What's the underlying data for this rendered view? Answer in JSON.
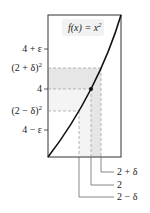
{
  "figure": {
    "function_label": "f(x) = x",
    "function_exponent": "2",
    "y_ticks": [
      {
        "id": "4-plus-eps",
        "label": "4 + ε"
      },
      {
        "id": "2-plus-delta-sq",
        "label": "(2 + δ)",
        "sup": "2"
      },
      {
        "id": "4",
        "label": "4"
      },
      {
        "id": "2-minus-delta-sq",
        "label": "(2 − δ)",
        "sup": "2"
      },
      {
        "id": "4-minus-eps",
        "label": "4 − ε"
      }
    ],
    "x_ticks": [
      {
        "id": "2-plus-delta",
        "label": "2 + δ"
      },
      {
        "id": "2",
        "label": "2"
      },
      {
        "id": "2-minus-delta",
        "label": "2 − δ"
      }
    ],
    "colors": {
      "curve": "#111111",
      "frame": "#333333",
      "band_dark": "#e6e6e6",
      "band_light": "#f4f4f4",
      "dash": "#9a9a9a"
    }
  }
}
